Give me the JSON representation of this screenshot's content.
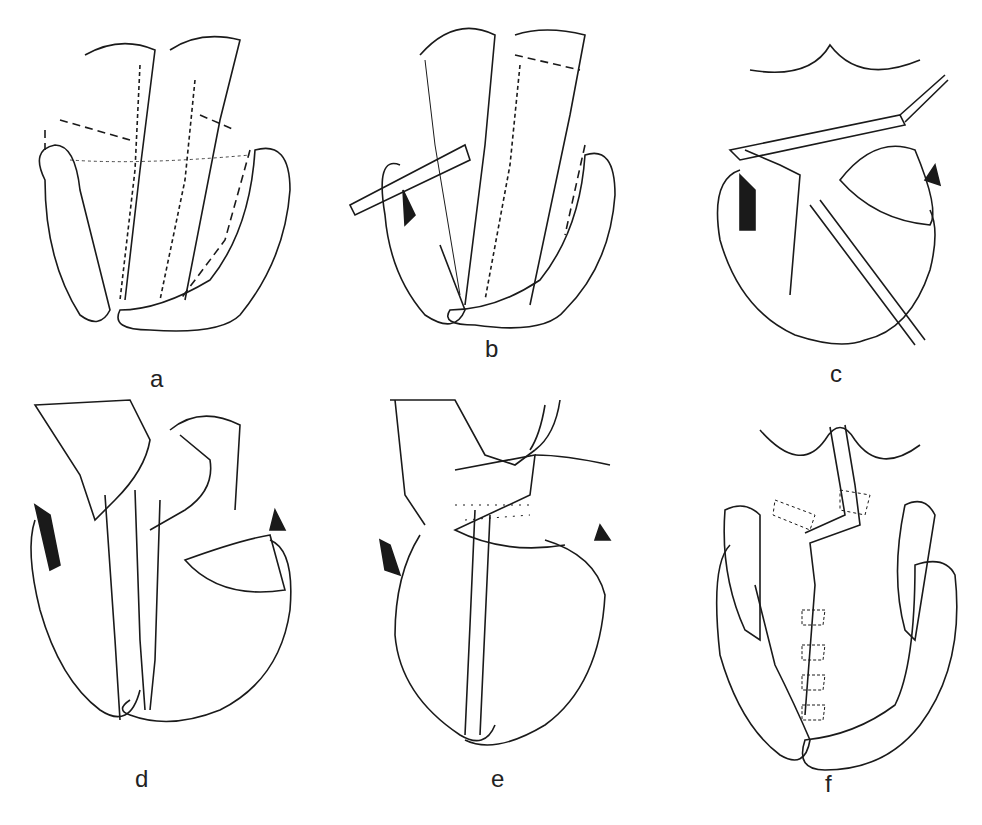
{
  "figure": {
    "type": "surgical line-art illustration sequence",
    "stroke_color": "#1a1a1a",
    "background": "#ffffff",
    "panels": [
      {
        "id": "a",
        "label": "a"
      },
      {
        "id": "b",
        "label": "b"
      },
      {
        "id": "c",
        "label": "c"
      },
      {
        "id": "d",
        "label": "d"
      },
      {
        "id": "e",
        "label": "e"
      },
      {
        "id": "f",
        "label": "f"
      }
    ]
  }
}
